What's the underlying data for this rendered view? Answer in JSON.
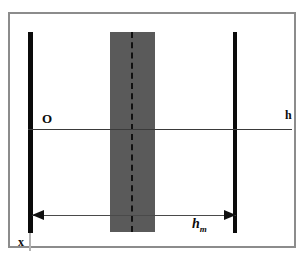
{
  "figure": {
    "background_color": "#ffffff",
    "frame_color": "#8c8c8c"
  },
  "labels": {
    "origin": "O",
    "h_axis": "h",
    "x_axis": "x",
    "dimension_symbol": "h",
    "dimension_subscript": "m"
  },
  "colors": {
    "wall": "#0b0b0b",
    "band": "#5a5a5a",
    "axis": "#3a3a3a",
    "arrow": "#4a4a4a",
    "frame": "#8c8c8c"
  },
  "geometry": {
    "frame": {
      "x": 8,
      "y": 12,
      "width": 288,
      "height": 236
    },
    "wall_left": {
      "x": 18,
      "y": 18,
      "width": 5,
      "height": 201
    },
    "wall_right": {
      "x": 223,
      "y": 18,
      "width": 4,
      "height": 201
    },
    "shaded_band": {
      "x": 100,
      "y": 18,
      "width": 45,
      "height": 200
    },
    "center_dashed_line": {
      "x": 121,
      "y": 18,
      "height": 200
    },
    "axis_h": {
      "x": 18,
      "y": 115,
      "length": 264
    },
    "dimension_arrow": {
      "x": 22,
      "y": 201,
      "length": 204
    }
  }
}
